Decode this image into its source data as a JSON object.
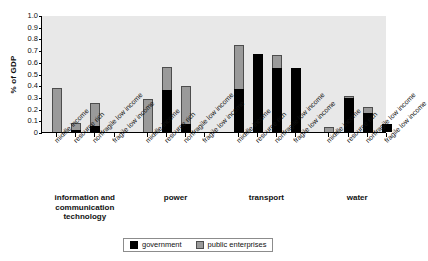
{
  "title_partial": "",
  "legend": {
    "items": [
      {
        "key": "government",
        "label": "government",
        "color": "#000000"
      },
      {
        "key": "public_enterprises",
        "label": "public enterprises",
        "color": "#9a9a9a"
      }
    ]
  },
  "chart_data": {
    "type": "bar",
    "stacked": true,
    "title": "",
    "xlabel": "",
    "ylabel": "% of GDP",
    "ylim": [
      0,
      1.0
    ],
    "ytick_labels": [
      "0",
      "0.1",
      "0.2",
      "0.3",
      "0.4",
      "0.5",
      "0.6",
      "0.7",
      "0.8",
      "0.9",
      "1.0"
    ],
    "ytick_values": [
      0,
      0.1,
      0.2,
      0.3,
      0.4,
      0.5,
      0.6,
      0.7,
      0.8,
      0.9,
      1.0
    ],
    "grid": false,
    "legend_position": "bottom",
    "categories": [
      "middle income",
      "resource rich",
      "nonfragile low income",
      "fragile low income"
    ],
    "groups": [
      {
        "name": "information and communication technology",
        "bars": [
          {
            "category": "middle income",
            "government": 0.0,
            "public_enterprises": 0.38,
            "total": 0.38
          },
          {
            "category": "resource rich",
            "government": 0.015,
            "public_enterprises": 0.065,
            "total": 0.08
          },
          {
            "category": "nonfragile low income",
            "government": 0.055,
            "public_enterprises": 0.195,
            "total": 0.25
          },
          {
            "category": "fragile low income",
            "government": 0.0,
            "public_enterprises": 0.0,
            "total": 0.0
          }
        ]
      },
      {
        "name": "power",
        "bars": [
          {
            "category": "middle income",
            "government": 0.0,
            "public_enterprises": 0.28,
            "total": 0.28
          },
          {
            "category": "resource rich",
            "government": 0.36,
            "public_enterprises": 0.195,
            "total": 0.555
          },
          {
            "category": "nonfragile low income",
            "government": 0.07,
            "public_enterprises": 0.32,
            "total": 0.39
          },
          {
            "category": "fragile low income",
            "government": 0.0,
            "public_enterprises": 0.0,
            "total": 0.0
          }
        ]
      },
      {
        "name": "transport",
        "bars": [
          {
            "category": "middle income",
            "government": 0.37,
            "public_enterprises": 0.375,
            "total": 0.745
          },
          {
            "category": "resource rich",
            "government": 0.665,
            "public_enterprises": 0.0,
            "total": 0.665
          },
          {
            "category": "nonfragile low income",
            "government": 0.545,
            "public_enterprises": 0.11,
            "total": 0.655
          },
          {
            "category": "fragile low income",
            "government": 0.55,
            "public_enterprises": 0.0,
            "total": 0.55
          }
        ]
      },
      {
        "name": "water",
        "bars": [
          {
            "category": "middle income",
            "government": 0.0,
            "public_enterprises": 0.04,
            "total": 0.04
          },
          {
            "category": "resource rich",
            "government": 0.29,
            "public_enterprises": 0.02,
            "total": 0.31
          },
          {
            "category": "nonfragile low income",
            "government": 0.16,
            "public_enterprises": 0.05,
            "total": 0.21
          },
          {
            "category": "fragile low income",
            "government": 0.07,
            "public_enterprises": 0.0,
            "total": 0.07
          }
        ]
      }
    ]
  }
}
